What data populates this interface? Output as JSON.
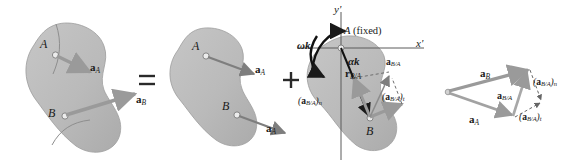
{
  "figure": {
    "background_color": "#ffffff",
    "body_fill_color": "#b9b9b9",
    "body_stroke_color": "#8a8a8a",
    "vector_color": "#9a9a9a",
    "vector_dark_color": "#7e7e7e",
    "axis_color": "#555555",
    "label_color": "#1a1a1a",
    "dashed_color": "#555555"
  },
  "operators": {
    "equals": "=",
    "plus": "+"
  },
  "panel1": {
    "name": "general-plane-motion",
    "points": [
      {
        "id": "A",
        "label": "A"
      },
      {
        "id": "B",
        "label": "B"
      }
    ],
    "vectors": [
      {
        "id": "aA",
        "base": "a",
        "sub": "A",
        "from": "A",
        "note": "acceleration of A"
      },
      {
        "id": "aB",
        "base": "a",
        "sub": "B",
        "from": "B",
        "note": "acceleration of B"
      }
    ]
  },
  "panel2": {
    "name": "translation",
    "points": [
      {
        "id": "A",
        "label": "A"
      },
      {
        "id": "B",
        "label": "B"
      }
    ],
    "vectors": [
      {
        "id": "aA_top",
        "base": "a",
        "sub": "A",
        "from": "A"
      },
      {
        "id": "aA_bottom",
        "base": "a",
        "sub": "A",
        "from": "B"
      }
    ]
  },
  "panel3": {
    "name": "rotation-about-A",
    "axes": {
      "x": "x'",
      "y": "y'"
    },
    "points": [
      {
        "id": "A",
        "label": "A (fixed)"
      },
      {
        "id": "B",
        "label": "B"
      }
    ],
    "rotation": {
      "omega": "ωk",
      "alpha": "αk"
    },
    "position_vector": {
      "base": "r",
      "sub": "B/A"
    },
    "vectors": [
      {
        "id": "aBA",
        "base": "a",
        "sub": "B/A",
        "note": "relative acceleration"
      },
      {
        "id": "aBA_n",
        "text_open": "(",
        "base": "a",
        "sub": "B/A",
        "text_close": ")",
        "comp": "n"
      },
      {
        "id": "aBA_t",
        "text_open": "(",
        "base": "a",
        "sub": "B/A",
        "text_close": ")",
        "comp": "t"
      }
    ]
  },
  "panel4": {
    "name": "acceleration-vector-polygon",
    "vectors": [
      {
        "id": "aB",
        "base": "a",
        "sub": "B"
      },
      {
        "id": "aA",
        "base": "a",
        "sub": "A"
      },
      {
        "id": "aBA",
        "base": "a",
        "sub": "B/A"
      },
      {
        "id": "aBA_n",
        "text_open": "(",
        "base": "a",
        "sub": "B/A",
        "text_close": ")",
        "comp": "n"
      },
      {
        "id": "aBA_t",
        "text_open": "(",
        "base": "a",
        "sub": "B/A",
        "text_close": ")",
        "comp": "t"
      }
    ]
  },
  "labels": {
    "A": "A",
    "B": "B",
    "A_fixed": "A (fixed)",
    "x_axis": "x'",
    "y_axis": "y'",
    "omega_k": "ωk",
    "alpha_k": "αk",
    "r_base": "r",
    "a_base": "a",
    "sub_A": "A",
    "sub_B": "B",
    "sub_BA": "B/A",
    "comp_n": "n",
    "comp_t": "t",
    "paren_open": "(",
    "paren_close": ")"
  }
}
